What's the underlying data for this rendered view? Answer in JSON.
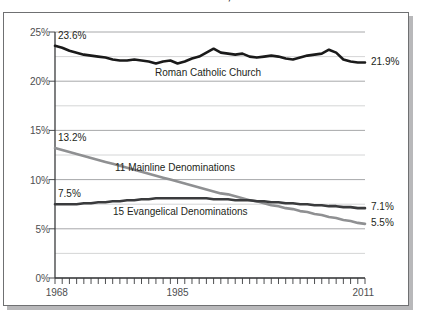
{
  "chart_data": {
    "type": "line",
    "title": "Catholic Church, 1968–2011",
    "xlabel": "",
    "ylabel": "",
    "xlim": [
      1968,
      2011
    ],
    "ylim": [
      0,
      25
    ],
    "grid": true,
    "legend_position": "inline-annotations",
    "y_ticks": [
      "0%",
      "5%",
      "10%",
      "15%",
      "20%",
      "25%"
    ],
    "y_tick_values": [
      0,
      5,
      10,
      15,
      20,
      25
    ],
    "x_ticks": [
      "1968",
      "1985",
      "2011"
    ],
    "x_tick_values": [
      1968,
      1985,
      2011
    ],
    "x_minor_tick_interval": 1,
    "y_minor_gridline_interval": 2.5,
    "series": [
      {
        "name": "Roman Catholic Church",
        "color": "#1a1a1a",
        "start_label": "23.6%",
        "end_label": "21.9%",
        "x": [
          1968,
          1969,
          1970,
          1971,
          1972,
          1973,
          1974,
          1975,
          1976,
          1977,
          1978,
          1979,
          1980,
          1981,
          1982,
          1983,
          1984,
          1985,
          1986,
          1987,
          1988,
          1989,
          1990,
          1991,
          1992,
          1993,
          1994,
          1995,
          1996,
          1997,
          1998,
          1999,
          2000,
          2001,
          2002,
          2003,
          2004,
          2005,
          2006,
          2007,
          2008,
          2009,
          2010,
          2011
        ],
        "values": [
          23.6,
          23.4,
          23.1,
          22.9,
          22.7,
          22.6,
          22.5,
          22.4,
          22.2,
          22.1,
          22.1,
          22.2,
          22.1,
          22.0,
          21.8,
          22.0,
          22.1,
          21.8,
          22.0,
          22.3,
          22.5,
          22.9,
          23.3,
          22.9,
          22.8,
          22.7,
          22.8,
          22.5,
          22.4,
          22.5,
          22.6,
          22.5,
          22.3,
          22.2,
          22.4,
          22.6,
          22.7,
          22.8,
          23.2,
          22.9,
          22.2,
          22.0,
          21.9,
          21.9
        ]
      },
      {
        "name": "11 Mainline Denominations",
        "color": "#8f9092",
        "start_label": "13.2%",
        "end_label": "5.5%",
        "x": [
          1968,
          1969,
          1970,
          1971,
          1972,
          1973,
          1974,
          1975,
          1976,
          1977,
          1978,
          1979,
          1980,
          1981,
          1982,
          1983,
          1984,
          1985,
          1986,
          1987,
          1988,
          1989,
          1990,
          1991,
          1992,
          1993,
          1994,
          1995,
          1996,
          1997,
          1998,
          1999,
          2000,
          2001,
          2002,
          2003,
          2004,
          2005,
          2006,
          2007,
          2008,
          2009,
          2010,
          2011
        ],
        "values": [
          13.2,
          13.0,
          12.8,
          12.6,
          12.4,
          12.2,
          12.0,
          11.8,
          11.6,
          11.4,
          11.2,
          11.0,
          10.8,
          10.6,
          10.4,
          10.2,
          10.0,
          9.8,
          9.6,
          9.4,
          9.2,
          9.0,
          8.8,
          8.6,
          8.5,
          8.3,
          8.1,
          7.9,
          7.8,
          7.6,
          7.4,
          7.3,
          7.1,
          7.0,
          6.8,
          6.7,
          6.5,
          6.4,
          6.2,
          6.1,
          5.9,
          5.8,
          5.6,
          5.5
        ]
      },
      {
        "name": "15 Evangelical Denominations",
        "color": "#3a3b3d",
        "start_label": "7.5%",
        "end_label": "7.1%",
        "x": [
          1968,
          1969,
          1970,
          1971,
          1972,
          1973,
          1974,
          1975,
          1976,
          1977,
          1978,
          1979,
          1980,
          1981,
          1982,
          1983,
          1984,
          1985,
          1986,
          1987,
          1988,
          1989,
          1990,
          1991,
          1992,
          1993,
          1994,
          1995,
          1996,
          1997,
          1998,
          1999,
          2000,
          2001,
          2002,
          2003,
          2004,
          2005,
          2006,
          2007,
          2008,
          2009,
          2010,
          2011
        ],
        "values": [
          7.5,
          7.5,
          7.5,
          7.5,
          7.6,
          7.6,
          7.7,
          7.7,
          7.8,
          7.8,
          7.9,
          7.9,
          8.0,
          8.0,
          8.1,
          8.1,
          8.1,
          8.1,
          8.1,
          8.1,
          8.1,
          8.1,
          8.0,
          8.0,
          8.0,
          7.9,
          7.9,
          7.9,
          7.8,
          7.8,
          7.7,
          7.7,
          7.6,
          7.6,
          7.5,
          7.5,
          7.4,
          7.4,
          7.3,
          7.3,
          7.2,
          7.2,
          7.1,
          7.1
        ]
      }
    ]
  }
}
